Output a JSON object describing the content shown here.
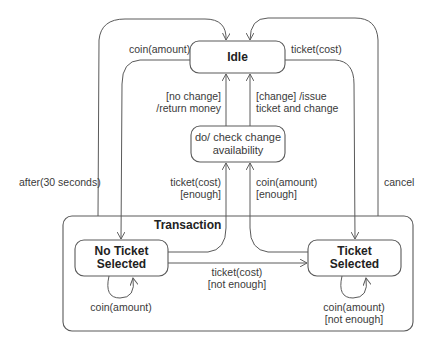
{
  "diagram": {
    "type": "UML state machine diagram",
    "states": {
      "idle": {
        "name": "Idle"
      },
      "check": {
        "line1": "do/ check change",
        "line2": "availability"
      },
      "no_ticket": {
        "line1": "No Ticket",
        "line2": "Selected"
      },
      "ticket": {
        "line1": "Ticket",
        "line2": "Selected"
      }
    },
    "composite": {
      "name": "Transaction"
    },
    "transitions": {
      "coin_amount_top": "coin(amount)",
      "ticket_cost_top": "ticket(cost)",
      "no_change_1": "[no change]",
      "no_change_2": "/return money",
      "change_1": "[change] /issue",
      "change_2": "ticket and change",
      "after": "after(30 seconds)",
      "cancel": "cancel",
      "ticket_enough_1": "ticket(cost)",
      "ticket_enough_2": "[enough]",
      "coin_enough_1": "coin(amount)",
      "coin_enough_2": "[enough]",
      "ticket_not_enough_1": "ticket(cost)",
      "ticket_not_enough_2": "[not enough]",
      "self_coin_left": "coin(amount)",
      "self_coin_right_1": "coin(amount)",
      "self_coin_right_2": "[not enough]"
    },
    "colors": {
      "stroke": "#5a5a5a",
      "text": "#333333",
      "background": "#ffffff"
    }
  }
}
